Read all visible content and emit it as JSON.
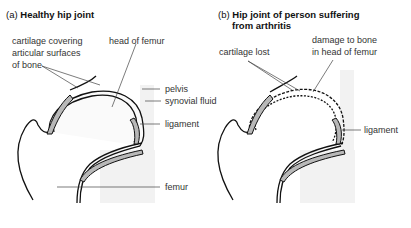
{
  "panel_a": {
    "prefix": "(a)",
    "title": "Healthy hip joint",
    "labels": {
      "cartilage_1": "cartilage covering",
      "cartilage_2": "articular surfaces",
      "cartilage_3": "of bone",
      "head_of_femur": "head of femur",
      "pelvis": "pelvis",
      "synovial_fluid": "synovial fluid",
      "ligament": "ligament",
      "femur": "femur"
    }
  },
  "panel_b": {
    "prefix": "(b)",
    "title_line1": "Hip joint of person suffering",
    "title_line2": "from arthritis",
    "labels": {
      "cartilage_lost": "cartilage lost",
      "damage_1": "damage to bone",
      "damage_2": "in head of femur",
      "ligament": "ligament"
    }
  },
  "colors": {
    "shading": "#f0f0f0",
    "cartilage": "#b8b8b8",
    "outline": "#111111",
    "leader": "#444444"
  }
}
